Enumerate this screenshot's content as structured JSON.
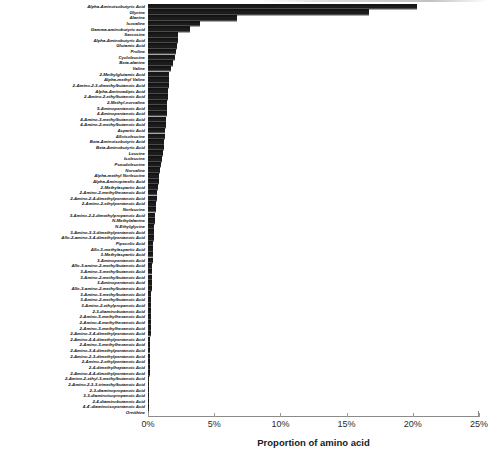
{
  "chart_data": {
    "type": "bar",
    "orientation": "horizontal",
    "title": "",
    "xlabel": "Proportion of amino acid",
    "ylabel": "",
    "xlim": [
      0,
      25
    ],
    "xunit": "%",
    "xticks": [
      0,
      5,
      10,
      15,
      20,
      25
    ],
    "xtick_labels": [
      "0%",
      "5%",
      "10%",
      "15%",
      "20%",
      "25%"
    ],
    "grid": false,
    "legend": false,
    "bar_color": "#1c1c1c",
    "categories": [
      "Alpha-Aminoisobutyric Acid",
      "Glycine",
      "Alanine",
      "Isovaline",
      "Gamma-aminobutyric acid",
      "Sarcosine",
      "Alpha-Aminobutyric Acid",
      "Glutamic Acid",
      "Proline",
      "Cycloleucine",
      "Beta-alanine",
      "Valine",
      "2-Methylglutamic Acid",
      "Alpha-methyl Valine",
      "2-Amino-2-3-dimethylbutanoic Acid",
      "Alpha-Aminoadipic Acid",
      "2-Amino-2-ethylbutanoic Acid",
      "2-Methyl-norvaline",
      "5-Aminopentanoic Acid",
      "4-Aminopentanoic Acid",
      "4-Amino-3-methylbutanoic Acid",
      "4-Amino-2-methylbutanoic Acid",
      "Aspartic Acid",
      "Alloisoleucine",
      "Beta-Aminoisobutyric Acid",
      "Beta-Aminobutyric Acid",
      "Leucine",
      "Isoleucine",
      "Pseudoleucine",
      "Norvaline",
      "Alpha-methyl Norleucine",
      "Alpha-Aminopimelic Acid",
      "2-Methylaspartic Acid",
      "2-Amino-2-methylhexanoic Acid",
      "2-Amino-2-4-dimethylpentanoic Acid",
      "2-Amino-2-ethylpentanoic Acid",
      "Norleucine",
      "3-Amino-2-2-dimethylpropanoic Acid",
      "N-Methylalanine",
      "N-Ethylglycine",
      "3-Amino-3-3-dimethylpentanoic Acid",
      "Allo-2-amino-3-4-dimethylpentanoic Acid",
      "Pipecolic Acid",
      "Allo-3-methylaspartic Acid",
      "3-Methylaspartic Acid",
      "3-Aminopentanoic Acid",
      "Allo-3-amino-2-methylbutanoic Acid",
      "3-Amino-3-methylbutanoic Acid",
      "3-Amino-2-methylbutanoic Acid",
      "3-Aminopentanoic Acid",
      "Allo-3-amino-2-methylbutanoic Acid",
      "3-Amino-3-methylbutanoic Acid",
      "3-Amino-2-methylbutanoic Acid",
      "3-Amino-2-ethylpropanoic Acid",
      "2-3-diaminobutanoic Acid",
      "2-Amino-5-methylhexanoic Acid",
      "2-Amino-4-methylhexanoic Acid",
      "2-Amino-3-methylhexanoic Acid",
      "2-Amino-3-4-dimethylpentanoic Acid",
      "2-Amino-4-4-dimethylpentanoic Acid",
      "2-Amino-3-methylhexanoic Acid",
      "2-Amino-3-4-dimethylpentanoic Acid",
      "2-Amino-2-3-dimethylpentanoic Acid",
      "2-Amino-2-ethylpentanoic Acid",
      "2-4-dimethylheptanoic Acid",
      "2-Amino-4-4-dimethylpentanoic Acid",
      "2-Amino-2-ethyl-3-methylbutanoic Acid",
      "2-Amino-2-3-3-trimethylbutanoic Acid",
      "2-3-diaminopropanoic Acid",
      "3-3-diaminoisopropanoic Acid",
      "2-4-diaminobutanoic Acid",
      "4-4'-diaminoisopentanoic Acid",
      "Ornithine"
    ],
    "values": [
      20.3,
      16.7,
      6.7,
      3.9,
      3.2,
      2.3,
      2.25,
      2.2,
      2.1,
      2.05,
      1.9,
      1.7,
      1.62,
      1.58,
      1.55,
      1.52,
      1.5,
      1.45,
      1.42,
      1.4,
      1.38,
      1.35,
      1.3,
      1.26,
      1.22,
      1.18,
      1.12,
      1.05,
      0.98,
      0.92,
      0.86,
      0.8,
      0.75,
      0.7,
      0.66,
      0.62,
      0.58,
      0.55,
      0.52,
      0.49,
      0.46,
      0.43,
      0.4,
      0.38,
      0.36,
      0.34,
      0.32,
      0.3,
      0.29,
      0.28,
      0.27,
      0.26,
      0.25,
      0.24,
      0.23,
      0.22,
      0.21,
      0.2,
      0.19,
      0.18,
      0.17,
      0.16,
      0.15,
      0.14,
      0.13,
      0.12,
      0.11,
      0.1,
      0.09,
      0.08,
      0.07,
      0.05,
      0.03
    ]
  }
}
